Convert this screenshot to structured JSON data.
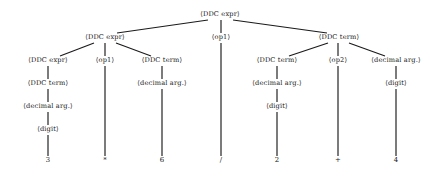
{
  "figure": {
    "kind": "parse-tree",
    "background_color": "#ffffff",
    "line_color": "#1a1a1a",
    "text_color": "#141414"
  },
  "nodes": [
    {
      "id": "n0",
      "label": "⟨DDC expr⟩",
      "x": 220,
      "y": 16,
      "level": 0
    },
    {
      "id": "n1",
      "label": "⟨DDC expr⟩",
      "x": 105,
      "y": 39,
      "level": 1
    },
    {
      "id": "n2",
      "label": "⟨op1⟩",
      "x": 221,
      "y": 39,
      "level": 1
    },
    {
      "id": "n3",
      "label": "⟨DDC term⟩",
      "x": 339,
      "y": 39,
      "level": 1
    },
    {
      "id": "n4",
      "label": "⟨DDC expr⟩",
      "x": 48,
      "y": 62,
      "level": 2
    },
    {
      "id": "n5",
      "label": "⟨op1⟩",
      "x": 105,
      "y": 62,
      "level": 2
    },
    {
      "id": "n6",
      "label": "⟨DDC term⟩",
      "x": 162,
      "y": 62,
      "level": 2
    },
    {
      "id": "n7",
      "label": "⟨DDC term⟩",
      "x": 277,
      "y": 62,
      "level": 2
    },
    {
      "id": "n8",
      "label": "⟨op2⟩",
      "x": 338,
      "y": 62,
      "level": 2
    },
    {
      "id": "n9",
      "label": "⟨decimal arg.⟩",
      "x": 396,
      "y": 62,
      "level": 2
    },
    {
      "id": "n10",
      "label": "⟨DDC term⟩",
      "x": 48,
      "y": 85,
      "level": 3
    },
    {
      "id": "n11",
      "label": "⟨decimal arg.⟩",
      "x": 162,
      "y": 85,
      "level": 3
    },
    {
      "id": "n12",
      "label": "⟨decimal arg.⟩",
      "x": 277,
      "y": 85,
      "level": 3
    },
    {
      "id": "n13",
      "label": "⟨digit⟩",
      "x": 396,
      "y": 85,
      "level": 3
    },
    {
      "id": "n14",
      "label": "⟨decimal arg.⟩",
      "x": 48,
      "y": 108,
      "level": 4
    },
    {
      "id": "n15",
      "label": "⟨digit⟩",
      "x": 277,
      "y": 108,
      "level": 4
    },
    {
      "id": "n16",
      "label": "⟨digit⟩",
      "x": 48,
      "y": 131,
      "level": 5
    }
  ],
  "terminals": [
    {
      "id": "t0",
      "label": "3",
      "x": 48,
      "y": 162
    },
    {
      "id": "t1",
      "label": "*",
      "x": 105,
      "y": 162
    },
    {
      "id": "t2",
      "label": "6",
      "x": 162,
      "y": 162
    },
    {
      "id": "t3",
      "label": "/",
      "x": 221,
      "y": 162
    },
    {
      "id": "t4",
      "label": "2",
      "x": 277,
      "y": 162
    },
    {
      "id": "t5",
      "label": "+",
      "x": 338,
      "y": 162
    },
    {
      "id": "t6",
      "label": "4",
      "x": 396,
      "y": 162
    }
  ],
  "edges": [
    {
      "from": "n0",
      "to": "n1",
      "x1": 208,
      "y1": 20,
      "x2": 117,
      "y2": 33
    },
    {
      "from": "n0",
      "to": "n2",
      "x1": 221,
      "y1": 20,
      "x2": 221,
      "y2": 33
    },
    {
      "from": "n0",
      "to": "n3",
      "x1": 233,
      "y1": 20,
      "x2": 327,
      "y2": 33
    },
    {
      "from": "n1",
      "to": "n4",
      "x1": 94,
      "y1": 43,
      "x2": 60,
      "y2": 56
    },
    {
      "from": "n1",
      "to": "n5",
      "x1": 105,
      "y1": 43,
      "x2": 105,
      "y2": 56
    },
    {
      "from": "n1",
      "to": "n6",
      "x1": 116,
      "y1": 43,
      "x2": 151,
      "y2": 56
    },
    {
      "from": "n3",
      "to": "n7",
      "x1": 328,
      "y1": 43,
      "x2": 289,
      "y2": 56
    },
    {
      "from": "n3",
      "to": "n8",
      "x1": 338,
      "y1": 43,
      "x2": 338,
      "y2": 56
    },
    {
      "from": "n3",
      "to": "n9",
      "x1": 349,
      "y1": 43,
      "x2": 385,
      "y2": 56
    },
    {
      "from": "n4",
      "to": "n10",
      "x1": 48,
      "y1": 66,
      "x2": 48,
      "y2": 79
    },
    {
      "from": "n6",
      "to": "n11",
      "x1": 162,
      "y1": 66,
      "x2": 162,
      "y2": 79
    },
    {
      "from": "n7",
      "to": "n12",
      "x1": 277,
      "y1": 66,
      "x2": 277,
      "y2": 79
    },
    {
      "from": "n9",
      "to": "n13",
      "x1": 396,
      "y1": 66,
      "x2": 396,
      "y2": 79
    },
    {
      "from": "n10",
      "to": "n14",
      "x1": 48,
      "y1": 89,
      "x2": 48,
      "y2": 102
    },
    {
      "from": "n12",
      "to": "n15",
      "x1": 277,
      "y1": 89,
      "x2": 277,
      "y2": 102
    },
    {
      "from": "n14",
      "to": "n16",
      "x1": 48,
      "y1": 112,
      "x2": 48,
      "y2": 125
    },
    {
      "from": "n16",
      "to": "t0",
      "x1": 48,
      "y1": 135,
      "x2": 48,
      "y2": 156
    },
    {
      "from": "n5",
      "to": "t1",
      "x1": 105,
      "y1": 66,
      "x2": 105,
      "y2": 156
    },
    {
      "from": "n11",
      "to": "t2",
      "x1": 162,
      "y1": 89,
      "x2": 162,
      "y2": 156
    },
    {
      "from": "n2",
      "to": "t3",
      "x1": 221,
      "y1": 43,
      "x2": 221,
      "y2": 156
    },
    {
      "from": "n15",
      "to": "t4",
      "x1": 277,
      "y1": 112,
      "x2": 277,
      "y2": 156
    },
    {
      "from": "n8",
      "to": "t5",
      "x1": 338,
      "y1": 66,
      "x2": 338,
      "y2": 156
    },
    {
      "from": "n13",
      "to": "t6",
      "x1": 396,
      "y1": 89,
      "x2": 396,
      "y2": 156
    }
  ]
}
